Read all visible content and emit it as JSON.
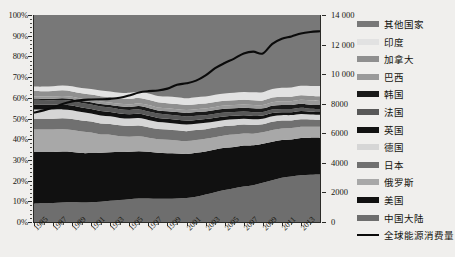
{
  "chart_data": {
    "type": "area",
    "title": "",
    "xlabel": "",
    "ylabel": "",
    "grid": false,
    "legend_position": "right",
    "stacked": true,
    "normalized_percent": true,
    "x": [
      1985,
      1986,
      1987,
      1988,
      1989,
      1990,
      1991,
      1992,
      1993,
      1994,
      1995,
      1996,
      1997,
      1998,
      1999,
      2000,
      2001,
      2002,
      2003,
      2004,
      2005,
      2006,
      2007,
      2008,
      2009,
      2010,
      2011,
      2012,
      2013,
      2014,
      2015
    ],
    "x_tick_labels": [
      "1985",
      "1987",
      "1989",
      "1991",
      "1993",
      "1995",
      "1997",
      "1999",
      "2001",
      "2003",
      "2005",
      "2007",
      "2009",
      "2011",
      "2013"
    ],
    "y_left": {
      "label": "",
      "ticks": [
        "0%",
        "10%",
        "20%",
        "30%",
        "40%",
        "50%",
        "60%",
        "70%",
        "80%",
        "90%",
        "100%"
      ],
      "min": 0,
      "max": 100
    },
    "y_right": {
      "label": "",
      "ticks": [
        "0",
        "2000",
        "4000",
        "6000",
        "8000",
        "10 000",
        "12 000",
        "14 000"
      ],
      "min": 0,
      "max": 14000
    },
    "series": [
      {
        "name": "中国大陆",
        "color": "#6e6e6e",
        "values": [
          8.8,
          9.0,
          9.2,
          9.4,
          9.5,
          9.4,
          9.6,
          9.8,
          10.2,
          10.6,
          11.0,
          11.3,
          11.4,
          11.2,
          11.2,
          11.3,
          11.6,
          12.2,
          13.3,
          14.4,
          15.3,
          16.2,
          17.0,
          17.6,
          19.0,
          20.2,
          21.4,
          22.0,
          22.6,
          22.9,
          23.0
        ]
      },
      {
        "name": "美国",
        "color": "#111111",
        "values": [
          25.0,
          24.8,
          24.6,
          24.6,
          24.3,
          23.9,
          23.7,
          23.6,
          23.5,
          23.2,
          22.9,
          22.9,
          22.5,
          22.2,
          22.0,
          21.8,
          21.2,
          21.2,
          20.8,
          20.6,
          20.2,
          19.7,
          19.6,
          19.1,
          18.8,
          18.6,
          18.2,
          17.9,
          18.0,
          17.9,
          17.7
        ]
      },
      {
        "name": "俄罗斯",
        "color": "#a8a8a8",
        "values": [
          10.9,
          10.9,
          10.9,
          10.8,
          10.7,
          10.4,
          9.9,
          8.9,
          8.4,
          7.6,
          7.3,
          7.2,
          6.8,
          6.6,
          6.5,
          6.3,
          6.3,
          6.2,
          6.1,
          6.0,
          5.9,
          5.9,
          5.7,
          5.6,
          5.5,
          5.6,
          5.6,
          5.5,
          5.4,
          5.3,
          5.3
        ]
      },
      {
        "name": "日本",
        "color": "#707070",
        "values": [
          5.2,
          5.2,
          5.2,
          5.3,
          5.3,
          5.3,
          5.3,
          5.3,
          5.2,
          5.3,
          5.2,
          5.2,
          5.1,
          4.9,
          5.0,
          4.9,
          4.8,
          4.8,
          4.6,
          4.6,
          4.5,
          4.4,
          4.3,
          4.1,
          3.9,
          4.0,
          3.8,
          3.7,
          3.6,
          3.5,
          3.4
        ]
      },
      {
        "name": "德国",
        "color": "#d6d6d6",
        "values": [
          4.5,
          4.4,
          4.4,
          4.3,
          4.2,
          4.1,
          3.9,
          3.8,
          3.7,
          3.6,
          3.6,
          3.6,
          3.5,
          3.4,
          3.3,
          3.2,
          3.2,
          3.1,
          3.1,
          3.0,
          2.9,
          2.9,
          2.8,
          2.8,
          2.7,
          2.7,
          2.6,
          2.6,
          2.6,
          2.4,
          2.4
        ]
      },
      {
        "name": "英国",
        "color": "#121212",
        "values": [
          2.4,
          2.4,
          2.3,
          2.3,
          2.3,
          2.2,
          2.2,
          2.2,
          2.1,
          2.1,
          2.0,
          2.1,
          2.0,
          2.0,
          1.9,
          1.9,
          1.9,
          1.8,
          1.8,
          1.8,
          1.7,
          1.7,
          1.6,
          1.6,
          1.5,
          1.5,
          1.4,
          1.4,
          1.4,
          1.3,
          1.3
        ]
      },
      {
        "name": "法国",
        "color": "#585858",
        "values": [
          2.2,
          2.2,
          2.2,
          2.2,
          2.2,
          2.2,
          2.2,
          2.2,
          2.1,
          2.1,
          2.1,
          2.1,
          2.1,
          2.1,
          2.0,
          2.0,
          2.0,
          2.0,
          1.9,
          1.9,
          1.9,
          1.8,
          1.8,
          1.8,
          1.7,
          1.7,
          1.6,
          1.6,
          1.6,
          1.5,
          1.5
        ]
      },
      {
        "name": "韩国",
        "color": "#1a1a1a",
        "values": [
          0.7,
          0.7,
          0.8,
          0.9,
          0.9,
          1.0,
          1.1,
          1.2,
          1.3,
          1.4,
          1.5,
          1.6,
          1.7,
          1.5,
          1.6,
          1.7,
          1.7,
          1.8,
          1.8,
          1.8,
          1.8,
          1.8,
          1.8,
          1.8,
          1.8,
          1.9,
          1.9,
          1.9,
          1.9,
          1.9,
          1.9
        ]
      },
      {
        "name": "巴西",
        "color": "#9a9a9a",
        "values": [
          1.0,
          1.0,
          1.1,
          1.1,
          1.1,
          1.1,
          1.1,
          1.2,
          1.2,
          1.2,
          1.3,
          1.3,
          1.4,
          1.4,
          1.4,
          1.4,
          1.4,
          1.4,
          1.4,
          1.5,
          1.5,
          1.5,
          1.6,
          1.6,
          1.6,
          1.7,
          1.8,
          1.8,
          1.9,
          2.0,
          2.0
        ]
      },
      {
        "name": "加拿大",
        "color": "#8f8f8f",
        "values": [
          2.6,
          2.6,
          2.6,
          2.7,
          2.6,
          2.6,
          2.6,
          2.6,
          2.6,
          2.6,
          2.6,
          2.6,
          2.5,
          2.5,
          2.5,
          2.5,
          2.4,
          2.4,
          2.4,
          2.4,
          2.3,
          2.3,
          2.3,
          2.3,
          2.2,
          2.2,
          2.2,
          2.2,
          2.2,
          2.2,
          2.2
        ]
      },
      {
        "name": "印度",
        "color": "#e2e2e2",
        "values": [
          2.1,
          2.2,
          2.3,
          2.4,
          2.5,
          2.5,
          2.6,
          2.7,
          2.7,
          2.8,
          2.9,
          3.0,
          3.1,
          3.1,
          3.2,
          3.3,
          3.3,
          3.4,
          3.4,
          3.5,
          3.5,
          3.6,
          3.7,
          3.8,
          4.0,
          4.1,
          4.3,
          4.5,
          4.6,
          4.9,
          5.0
        ]
      },
      {
        "name": "其他国家",
        "color": "#787878",
        "values": [
          34.6,
          34.6,
          34.4,
          34.0,
          34.4,
          35.3,
          35.8,
          36.5,
          36.9,
          37.5,
          37.6,
          37.1,
          37.9,
          39.1,
          39.4,
          39.7,
          40.2,
          39.7,
          39.4,
          38.5,
          37.5,
          37.2,
          36.8,
          37.0,
          37.3,
          35.8,
          35.2,
          35.0,
          34.2,
          34.3,
          34.3
        ]
      }
    ],
    "line_series": {
      "name": "全球能源消费量",
      "color": "#0b0b0b",
      "axis": "right",
      "values": [
        7400,
        7550,
        7750,
        7980,
        8150,
        8250,
        8280,
        8300,
        8330,
        8400,
        8560,
        8760,
        8850,
        8890,
        9020,
        9280,
        9380,
        9560,
        9920,
        10400,
        10750,
        11050,
        11400,
        11520,
        11400,
        12050,
        12400,
        12550,
        12750,
        12850,
        12900
      ]
    }
  },
  "legend": {
    "items": [
      {
        "label": "其他国家",
        "color": "#787878",
        "type": "swatch"
      },
      {
        "label": "印度",
        "color": "#e2e2e2",
        "type": "swatch"
      },
      {
        "label": "加拿大",
        "color": "#8f8f8f",
        "type": "swatch"
      },
      {
        "label": "巴西",
        "color": "#9a9a9a",
        "type": "swatch"
      },
      {
        "label": "韩国",
        "color": "#1a1a1a",
        "type": "swatch"
      },
      {
        "label": "法国",
        "color": "#585858",
        "type": "swatch"
      },
      {
        "label": "英国",
        "color": "#121212",
        "type": "swatch"
      },
      {
        "label": "德国",
        "color": "#d6d6d6",
        "type": "swatch"
      },
      {
        "label": "日本",
        "color": "#707070",
        "type": "swatch"
      },
      {
        "label": "俄罗斯",
        "color": "#a8a8a8",
        "type": "swatch"
      },
      {
        "label": "美国",
        "color": "#111111",
        "type": "swatch"
      },
      {
        "label": "中国大陆",
        "color": "#6e6e6e",
        "type": "swatch"
      },
      {
        "label": "全球能源消费量",
        "color": "#0b0b0b",
        "type": "line"
      }
    ]
  }
}
